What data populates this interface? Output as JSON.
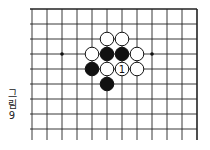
{
  "figure": {
    "caption_lines": [
      "그",
      "림",
      "9"
    ],
    "caption": "그림 9"
  },
  "board": {
    "origin_x": 32,
    "origin_y": 9,
    "spacing": 15,
    "cols": 12,
    "rows": 9,
    "top_edge": true,
    "right_edge": true,
    "line_color": "#222222",
    "star_points": [
      [
        2,
        3
      ],
      [
        8,
        3
      ]
    ],
    "stones": [
      {
        "col": 5,
        "row": 2,
        "color": "white",
        "label": ""
      },
      {
        "col": 6,
        "row": 2,
        "color": "white",
        "label": ""
      },
      {
        "col": 4,
        "row": 3,
        "color": "white",
        "label": ""
      },
      {
        "col": 5,
        "row": 3,
        "color": "black",
        "label": ""
      },
      {
        "col": 6,
        "row": 3,
        "color": "black",
        "label": ""
      },
      {
        "col": 7,
        "row": 3,
        "color": "white",
        "label": ""
      },
      {
        "col": 4,
        "row": 4,
        "color": "black",
        "label": ""
      },
      {
        "col": 5,
        "row": 4,
        "color": "white",
        "label": ""
      },
      {
        "col": 6,
        "row": 4,
        "color": "white",
        "label": "1"
      },
      {
        "col": 7,
        "row": 4,
        "color": "white",
        "label": ""
      },
      {
        "col": 5,
        "row": 5,
        "color": "black",
        "label": ""
      }
    ]
  }
}
